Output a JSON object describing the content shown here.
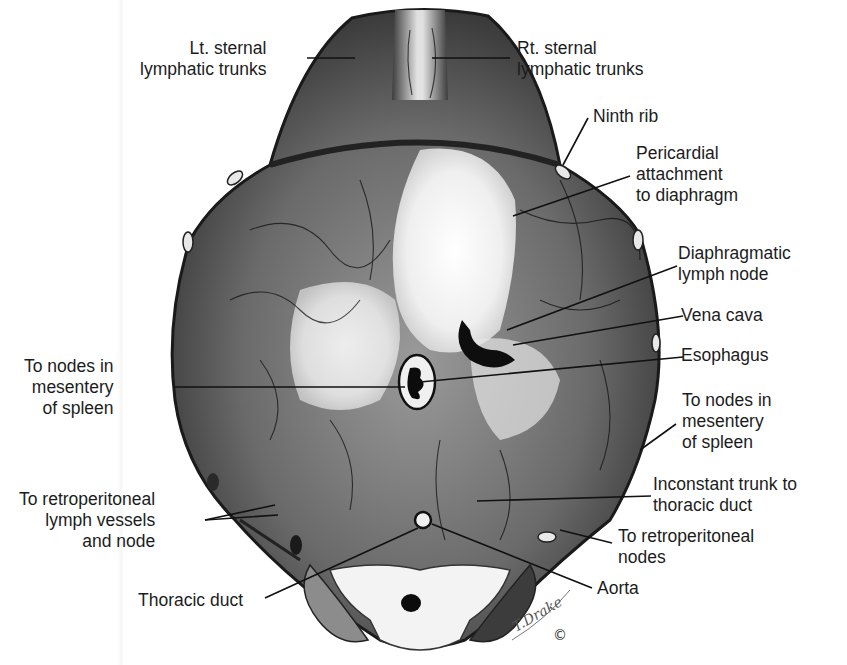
{
  "figure": {
    "colors": {
      "background": "#ffffff",
      "ink": "#1c1c1c",
      "tissue_dark": "#3a3a3a",
      "tissue_mid": "#8a8a8a",
      "tendon_light": "#f4f4f4"
    },
    "signature": "T.Drake",
    "copyright_mark": "©"
  },
  "labels": {
    "lt_sternal": "Lt. sternal\nlymphatic trunks",
    "rt_sternal": "Rt. sternal\nlymphatic trunks",
    "ninth_rib": "Ninth rib",
    "pericardial": "Pericardial\nattachment\nto diaphragm",
    "diaphragmatic_node": "Diaphragmatic\nlymph node",
    "vena_cava": "Vena cava",
    "esophagus": "Esophagus",
    "spleen_left": "To nodes in\nmesentery\nof spleen",
    "spleen_right": "To nodes in\nmesentery\nof spleen",
    "inconstant_trunk": "Inconstant trunk to\nthoracic duct",
    "retro_vessels": "To retroperitoneal\nlymph vessels\nand node",
    "retro_nodes": "To retroperitoneal\nnodes",
    "aorta": "Aorta",
    "thoracic_duct": "Thoracic duct"
  }
}
